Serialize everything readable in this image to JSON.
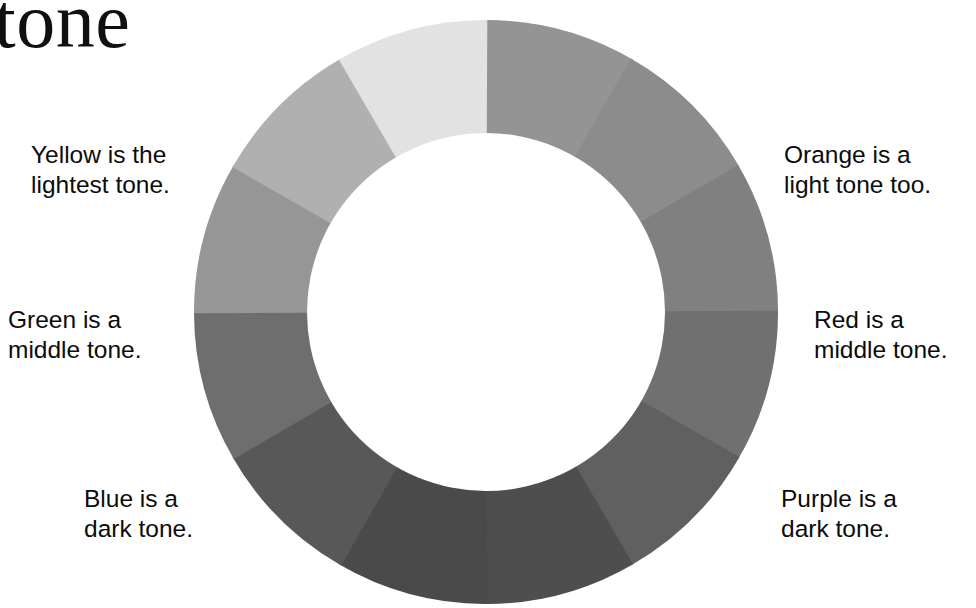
{
  "title": "tone",
  "wheel": {
    "name": "tone-wheel",
    "segment_count": 12,
    "segment_degrees": 30,
    "outer_radius": 292,
    "inner_radius": 179,
    "center": [
      486,
      312
    ],
    "inner_fill": "#ffffff",
    "background": "#ffffff"
  },
  "callouts": {
    "yellow": "Yellow is the\nlightest tone.",
    "orange": "Orange is a\nlight tone too.",
    "green": "Green is a\nmiddle tone.",
    "red": "Red is a\nmiddle tone.",
    "blue": "Blue is a\ndark tone.",
    "purple": "Purple is a\ndark tone."
  },
  "chart_data": {
    "type": "pie",
    "title": "tone",
    "xlabel": "",
    "ylabel": "",
    "legend": "none",
    "grid": false,
    "categories": [
      "Yellow-Green",
      "Green",
      "Blue-Green",
      "Blue",
      "Blue-Violet",
      "Violet / Purple",
      "Red-Violet",
      "Red",
      "Red-Orange",
      "Orange",
      "Yellow-Orange",
      "Yellow"
    ],
    "values": [
      30,
      30,
      30,
      30,
      30,
      30,
      30,
      30,
      30,
      30,
      30,
      30
    ],
    "series": [
      {
        "name": "greyscale tone value",
        "values": [
          148,
          140,
          128,
          112,
          96,
          78,
          74,
          88,
          110,
          150,
          176,
          226
        ]
      }
    ],
    "segments": [
      {
        "index": 0,
        "hue": "Yellow-Green",
        "start_deg": 0,
        "end_deg": 30,
        "gray": "#949494",
        "tone": "middle"
      },
      {
        "index": 1,
        "hue": "Green",
        "start_deg": 30,
        "end_deg": 60,
        "gray": "#8c8c8c",
        "tone": "middle"
      },
      {
        "index": 2,
        "hue": "Blue-Green",
        "start_deg": 60,
        "end_deg": 90,
        "gray": "#808080",
        "tone": "middle"
      },
      {
        "index": 3,
        "hue": "Blue",
        "start_deg": 90,
        "end_deg": 120,
        "gray": "#707070",
        "tone": "dark"
      },
      {
        "index": 4,
        "hue": "Blue-Violet",
        "start_deg": 120,
        "end_deg": 150,
        "gray": "#606060",
        "tone": "dark"
      },
      {
        "index": 5,
        "hue": "Violet / Purple",
        "start_deg": 150,
        "end_deg": 180,
        "gray": "#4e4e4e",
        "tone": "dark"
      },
      {
        "index": 6,
        "hue": "Red-Violet",
        "start_deg": 180,
        "end_deg": 210,
        "gray": "#4a4a4a",
        "tone": "dark"
      },
      {
        "index": 7,
        "hue": "Red",
        "start_deg": 210,
        "end_deg": 240,
        "gray": "#585858",
        "tone": "dark"
      },
      {
        "index": 8,
        "hue": "Red-Orange",
        "start_deg": 240,
        "end_deg": 270,
        "gray": "#6e6e6e",
        "tone": "middle"
      },
      {
        "index": 9,
        "hue": "Orange",
        "start_deg": 270,
        "end_deg": 300,
        "gray": "#969696",
        "tone": "middle"
      },
      {
        "index": 10,
        "hue": "Yellow-Orange",
        "start_deg": 300,
        "end_deg": 330,
        "gray": "#b0b0b0",
        "tone": "light"
      },
      {
        "index": 11,
        "hue": "Yellow",
        "start_deg": 330,
        "end_deg": 360,
        "gray": "#e2e2e2",
        "tone": "lightest"
      }
    ]
  }
}
